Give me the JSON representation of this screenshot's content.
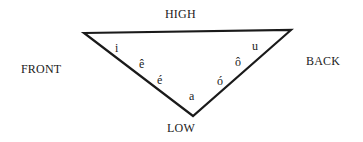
{
  "diagram": {
    "axes": {
      "top": "HIGH",
      "bottom": "LOW",
      "left": "FRONT",
      "right": "BACK"
    },
    "triangle": {
      "vertices": {
        "front_high": [
          84,
          33
        ],
        "back_high": [
          291,
          30
        ],
        "low": [
          193,
          116
        ]
      },
      "stroke_color": "#1a1a1a"
    },
    "vowels": [
      {
        "symbol": "i",
        "position": "front-high"
      },
      {
        "symbol": "ê",
        "position": "front-mid-high"
      },
      {
        "symbol": "é",
        "position": "front-mid-low"
      },
      {
        "symbol": "a",
        "position": "low-central"
      },
      {
        "symbol": "ó",
        "position": "back-mid-low"
      },
      {
        "symbol": "ô",
        "position": "back-mid-high"
      },
      {
        "symbol": "u",
        "position": "back-high"
      }
    ]
  }
}
